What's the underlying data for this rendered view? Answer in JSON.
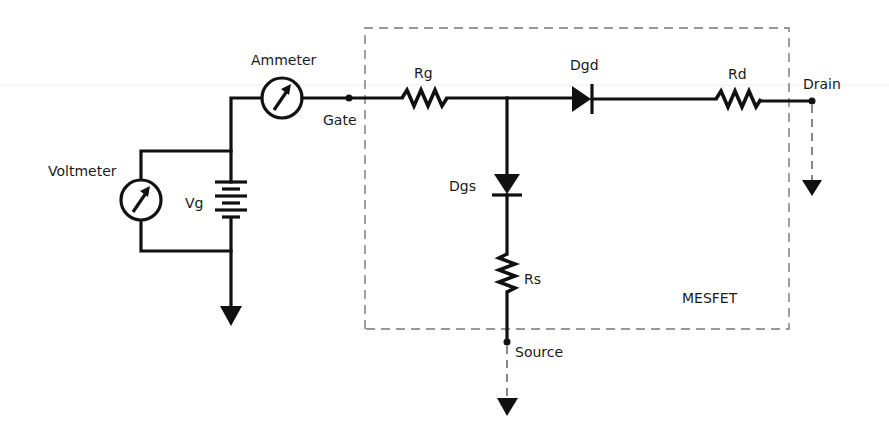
{
  "diagram": {
    "type": "circuit-schematic",
    "labels": {
      "ammeter": "Ammeter",
      "voltmeter": "Voltmeter",
      "vg": "Vg",
      "gate": "Gate",
      "rg": "Rg",
      "dgd": "Dgd",
      "rd": "Rd",
      "drain": "Drain",
      "dgs": "Dgs",
      "rs": "Rs",
      "source": "Source",
      "mesfet": "MESFET"
    },
    "components": [
      {
        "id": "ammeter",
        "kind": "meter",
        "label": "Ammeter"
      },
      {
        "id": "voltmeter",
        "kind": "meter",
        "label": "Voltmeter"
      },
      {
        "id": "vg",
        "kind": "battery",
        "label": "Vg"
      },
      {
        "id": "rg",
        "kind": "resistor",
        "label": "Rg"
      },
      {
        "id": "dgd",
        "kind": "diode",
        "label": "Dgd"
      },
      {
        "id": "rd",
        "kind": "resistor",
        "label": "Rd"
      },
      {
        "id": "dgs",
        "kind": "diode",
        "label": "Dgs"
      },
      {
        "id": "rs",
        "kind": "resistor",
        "label": "Rs"
      }
    ],
    "terminals": [
      "Gate",
      "Drain",
      "Source"
    ],
    "enclosure_label": "MESFET",
    "colors": {
      "wire": "#111111",
      "dashed_box": "#777777",
      "text": "#1a1a1a",
      "background": "#ffffff"
    }
  }
}
